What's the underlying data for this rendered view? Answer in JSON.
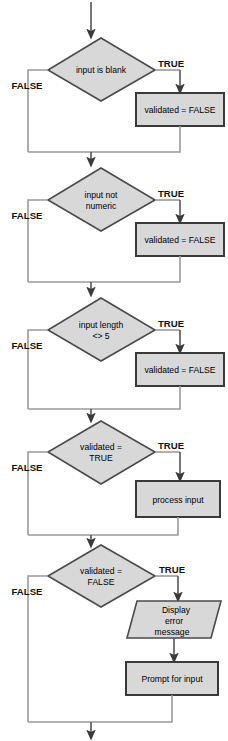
{
  "diagram": {
    "colors": {
      "shape_fill": "#d8d8d8",
      "shape_stroke": "#4a4a4a",
      "box_stroke": "#3a3a3a",
      "connector": "#9a9a9a",
      "text": "#000000",
      "background": "#ffffff"
    },
    "labels": {
      "true": "TRUE",
      "false": "FALSE"
    },
    "sections": [
      {
        "id": "blank-check",
        "decision": {
          "line1": "input is blank",
          "line2": ""
        },
        "true_label": "TRUE",
        "false_label": "FALSE",
        "action": {
          "type": "process",
          "line1": "validated = FALSE",
          "line2": "",
          "line3": ""
        }
      },
      {
        "id": "numeric-check",
        "decision": {
          "line1": "input not",
          "line2": "numeric"
        },
        "true_label": "TRUE",
        "false_label": "FALSE",
        "action": {
          "type": "process",
          "line1": "validated = FALSE",
          "line2": "",
          "line3": ""
        }
      },
      {
        "id": "length-check",
        "decision": {
          "line1": "input length",
          "line2": "<> 5"
        },
        "true_label": "TRUE",
        "false_label": "FALSE",
        "action": {
          "type": "process",
          "line1": "validated = FALSE",
          "line2": "",
          "line3": ""
        }
      },
      {
        "id": "validated-true-check",
        "decision": {
          "line1": "validated =",
          "line2": "TRUE"
        },
        "true_label": "TRUE",
        "false_label": "FALSE",
        "action": {
          "type": "process",
          "line1": "process input",
          "line2": "",
          "line3": ""
        }
      },
      {
        "id": "validated-false-check",
        "decision": {
          "line1": "validated =",
          "line2": "FALSE"
        },
        "true_label": "TRUE",
        "false_label": "FALSE",
        "action": {
          "type": "io",
          "line1": "Display",
          "line2": "error",
          "line3": "message"
        },
        "action2": {
          "type": "process",
          "line1": "Prompt for input",
          "line2": "",
          "line3": ""
        }
      }
    ]
  }
}
